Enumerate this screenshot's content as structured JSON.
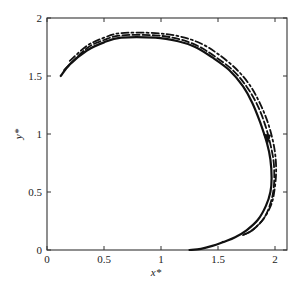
{
  "chart_data": {
    "type": "line",
    "title": "",
    "xlabel": "x*",
    "ylabel": "y*",
    "xlim": [
      0,
      2.08
    ],
    "ylim": [
      0,
      2
    ],
    "grid": false,
    "legend": null,
    "x_ticks": [
      0,
      0.5,
      1,
      1.5,
      2
    ],
    "y_ticks": [
      0,
      0.5,
      1,
      1.5,
      2
    ],
    "x_tick_labels": [
      "0",
      "0.5",
      "1",
      "1.5",
      "2"
    ],
    "y_tick_labels": [
      "0",
      "0.5",
      "1",
      "1.5",
      "2"
    ],
    "series": [
      {
        "name": "solid",
        "style": "solid",
        "x": [
          0.12,
          0.2,
          0.35,
          0.5,
          0.65,
          0.95,
          1.15,
          1.3,
          1.45,
          1.6,
          1.72,
          1.8,
          1.87,
          1.93,
          1.96,
          1.97,
          1.96,
          1.92,
          1.85,
          1.75,
          1.65,
          1.55,
          1.45,
          1.35,
          1.25
        ],
        "y": [
          1.5,
          1.6,
          1.72,
          1.79,
          1.83,
          1.83,
          1.8,
          1.75,
          1.66,
          1.55,
          1.41,
          1.27,
          1.1,
          0.92,
          0.78,
          0.62,
          0.5,
          0.38,
          0.26,
          0.17,
          0.11,
          0.07,
          0.035,
          0.01,
          0.0
        ]
      },
      {
        "name": "dashed",
        "style": "dashed",
        "x": [
          0.15,
          0.35,
          0.5,
          0.65,
          0.95,
          1.15,
          1.32,
          1.47,
          1.63,
          1.75,
          1.84,
          1.91,
          1.96,
          1.99,
          1.99,
          1.96,
          1.9,
          1.8,
          1.7
        ],
        "y": [
          1.55,
          1.74,
          1.81,
          1.85,
          1.85,
          1.82,
          1.76,
          1.67,
          1.55,
          1.41,
          1.26,
          1.09,
          0.91,
          0.74,
          0.55,
          0.4,
          0.27,
          0.17,
          0.12
        ]
      },
      {
        "name": "dash-dot",
        "style": "dashdot",
        "x": [
          0.2,
          0.35,
          0.5,
          0.65,
          0.95,
          1.17,
          1.35,
          1.5,
          1.66,
          1.78,
          1.87,
          1.94,
          1.99,
          2.01,
          2.0,
          1.97,
          1.9,
          1.8,
          1.72
        ],
        "y": [
          1.63,
          1.76,
          1.83,
          1.87,
          1.87,
          1.84,
          1.78,
          1.69,
          1.56,
          1.42,
          1.26,
          1.09,
          0.9,
          0.72,
          0.55,
          0.4,
          0.27,
          0.17,
          0.13
        ]
      }
    ],
    "annotations": [
      {
        "type": "arrow",
        "x": 1.93,
        "y": 0.95,
        "direction": "down",
        "on_series": "solid"
      }
    ]
  },
  "frame": {
    "left_px": 47,
    "right_px": 287,
    "top_px": 18,
    "bottom_px": 250,
    "x0_px": 47,
    "x_scale": 114,
    "y0_px": 250,
    "y_scale": 116
  }
}
